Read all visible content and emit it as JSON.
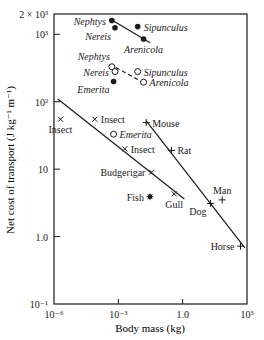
{
  "chart_data": {
    "type": "scatter",
    "title": "",
    "xlabel": "Body mass (kg)",
    "ylabel": "Net cost of transport (J kg⁻¹ m⁻¹)",
    "xscale": "log",
    "yscale": "log",
    "xlim": [
      1e-06,
      1000
    ],
    "ylim": [
      0.1,
      2000
    ],
    "grid": false,
    "legend": "none (points labelled directly)",
    "x_ticks": [
      {
        "value": 1e-06,
        "label": "10⁻⁶"
      },
      {
        "value": 0.001,
        "label": "10⁻³"
      },
      {
        "value": 1,
        "label": "1.0"
      },
      {
        "value": 1000,
        "label": "10³"
      }
    ],
    "y_ticks": [
      {
        "value": 0.1,
        "label": "10⁻¹"
      },
      {
        "value": 1,
        "label": "1.0"
      },
      {
        "value": 10,
        "label": "10"
      },
      {
        "value": 100,
        "label": "10²"
      },
      {
        "value": 1000,
        "label": "10³"
      },
      {
        "value": 2000,
        "label": "2 × 10³"
      }
    ],
    "series": [
      {
        "name": "Burrowing (filled circles)",
        "marker": "filled-circle",
        "points": [
          {
            "label": "Nephtys",
            "x": 0.0005,
            "y": 1600,
            "label_side": "left"
          },
          {
            "label": "Nereis",
            "x": 0.0007,
            "y": 1250,
            "label_side": "below-left"
          },
          {
            "label": "Sipunculus",
            "x": 0.008,
            "y": 1300,
            "label_side": "right"
          },
          {
            "label": "Arenicola",
            "x": 0.015,
            "y": 850,
            "label_side": "below"
          },
          {
            "label": "Emerita",
            "x": 0.0006,
            "y": 200,
            "label_side": "below-left"
          }
        ],
        "fit_line": {
          "style": "solid",
          "from": [
            0.0004,
            1700
          ],
          "to": [
            0.03,
            750
          ]
        }
      },
      {
        "name": "Burrowing (open circles)",
        "marker": "open-circle",
        "points": [
          {
            "label": "Nephtys",
            "x": 0.0005,
            "y": 330,
            "label_side": "above-left"
          },
          {
            "label": "Nereis",
            "x": 0.0007,
            "y": 280,
            "label_side": "left"
          },
          {
            "label": "Sipunculus",
            "x": 0.008,
            "y": 280,
            "label_side": "right"
          },
          {
            "label": "Arenicola",
            "x": 0.015,
            "y": 195,
            "label_side": "right"
          }
        ],
        "fit_line": {
          "style": "dashed",
          "from": [
            0.0004,
            360
          ],
          "to": [
            0.016,
            190
          ]
        }
      },
      {
        "name": "Running (+)",
        "marker": "plus",
        "points": [
          {
            "label": "Mouse",
            "x": 0.02,
            "y": 49,
            "label_side": "right"
          },
          {
            "label": "Rat",
            "x": 0.3,
            "y": 19,
            "label_side": "right"
          },
          {
            "label": "Dog",
            "x": 20,
            "y": 3.1,
            "label_side": "below-left"
          },
          {
            "label": "Man",
            "x": 70,
            "y": 3.5,
            "label_side": "above"
          },
          {
            "label": "Horse",
            "x": 500,
            "y": 0.72,
            "label_side": "left"
          }
        ],
        "fit_line": {
          "style": "solid",
          "from": [
            0.02,
            52
          ],
          "to": [
            800,
            0.68
          ]
        }
      },
      {
        "name": "Flying (×)",
        "marker": "cross",
        "points": [
          {
            "label": "Insect",
            "x": 2e-06,
            "y": 55,
            "label_side": "below"
          },
          {
            "label": "Insect",
            "x": 8e-05,
            "y": 55,
            "label_side": "right"
          },
          {
            "label": "Insect",
            "x": 0.002,
            "y": 20,
            "label_side": "right"
          },
          {
            "label": "Budgerigar",
            "x": 0.035,
            "y": 9,
            "label_side": "left"
          },
          {
            "label": "Gull",
            "x": 0.4,
            "y": 4.3,
            "label_side": "below"
          }
        ],
        "fit_line": {
          "style": "solid",
          "from": [
            1.5e-06,
            110
          ],
          "to": [
            1.2,
            3.6
          ]
        }
      },
      {
        "name": "Swimming (open circle)",
        "marker": "open-circle",
        "points": [
          {
            "label": "Emerita",
            "x": 0.0006,
            "y": 33,
            "label_side": "right"
          }
        ]
      },
      {
        "name": "Swimming (asterisk)",
        "marker": "asterisk",
        "points": [
          {
            "label": "Fish",
            "x": 0.03,
            "y": 3.9,
            "label_side": "left"
          }
        ]
      }
    ]
  },
  "axes": {
    "xlabel": "Body mass (kg)",
    "ylabel": "Net cost of transport (J kg⁻¹ m⁻¹)"
  },
  "colors": {
    "ink": "#1a1a1a",
    "background": "#ffffff"
  }
}
